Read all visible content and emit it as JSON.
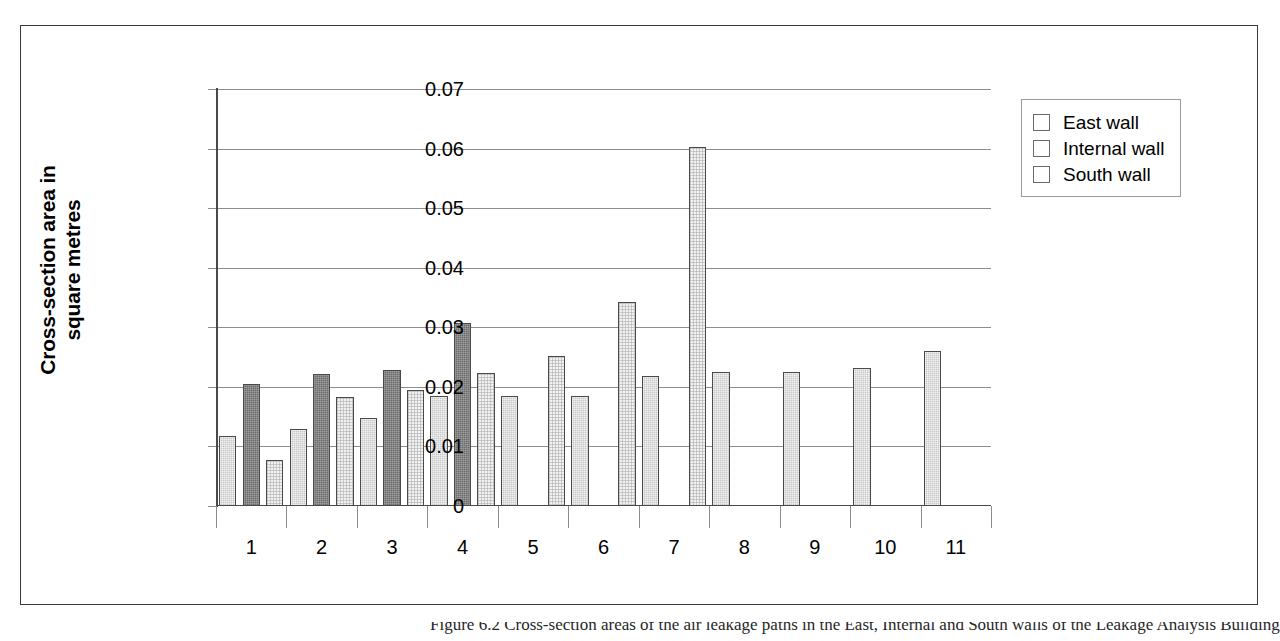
{
  "figure": {
    "caption_partial": "Figure 6.2  Cross-section areas of the air leakage paths in the East, Internal and South walls of the Leakage Analysis Building",
    "axis_colors": {
      "gridline": "#8d8d8d",
      "axis": "#4a4a4a",
      "frame": "#3a3a3a"
    }
  },
  "chart_data": {
    "type": "bar",
    "title": "",
    "subtitle": "",
    "xlabel": "",
    "ylabel": "Cross-section area in square metres",
    "ylabel_lines": [
      "Cross-section area in",
      "square metres"
    ],
    "categories": [
      "1",
      "2",
      "3",
      "4",
      "5",
      "6",
      "7",
      "8",
      "9",
      "10",
      "11"
    ],
    "ylim": [
      0,
      0.07
    ],
    "ytick_labels": [
      "0.07",
      "0.06",
      "0.05",
      "0.04",
      "0.03",
      "0.02",
      "0.01",
      "0"
    ],
    "ytick_values": [
      0.07,
      0.06,
      0.05,
      0.04,
      0.03,
      0.02,
      0.01,
      0
    ],
    "grid": true,
    "legend_position": "top-right",
    "series": [
      {
        "name": "East wall",
        "color": "#c8c8c8",
        "values": [
          0.0118,
          0.0129,
          0.0148,
          0.0185,
          0.0185,
          0.0185,
          0.0219,
          0.0225,
          0.0225,
          0.0231,
          0.026
        ]
      },
      {
        "name": "Internal wall",
        "color": "#6b6b6b",
        "values": [
          0.0205,
          0.0222,
          0.0229,
          0.0307,
          null,
          null,
          null,
          null,
          null,
          null,
          null
        ]
      },
      {
        "name": "South wall",
        "color": "#f1f1f1",
        "values": [
          0.0078,
          0.0183,
          0.0195,
          0.0224,
          0.0252,
          0.0342,
          0.0602,
          null,
          null,
          null,
          null
        ]
      }
    ]
  },
  "legend": {
    "items": [
      {
        "label": "East wall",
        "swatch": "east-wall-swatch"
      },
      {
        "label": "Internal wall",
        "swatch": "internal-wall-swatch"
      },
      {
        "label": "South wall",
        "swatch": "south-wall-swatch"
      }
    ]
  }
}
